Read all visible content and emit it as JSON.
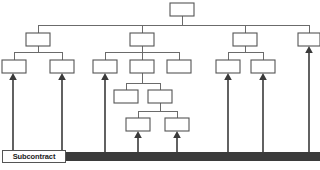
{
  "diagram": {
    "type": "work-breakdown-structure",
    "title": "",
    "canvas": {
      "width": 320,
      "height": 170,
      "background": "#ffffff"
    },
    "colors": {
      "box_fill": "#ffffff",
      "box_stroke": "#555555",
      "connector": "#6b6b6b",
      "arrow": "#3a3a3a",
      "bar": "#3b3b3b",
      "label_text": "#1a1a1a"
    },
    "labels": {
      "subcontract": "Subcontract"
    },
    "bus_line_y": 25,
    "bar": {
      "x": 8,
      "y": 152,
      "width": 312,
      "height": 9
    },
    "subcontract_chip": {
      "x": 2,
      "y": 150,
      "width": 64,
      "height": 13
    },
    "boxes": [
      {
        "id": "n0",
        "level": 1,
        "x": 170,
        "y": 3,
        "w": 24,
        "h": 13,
        "label": ""
      },
      {
        "id": "n1",
        "level": 2,
        "x": 26,
        "y": 33,
        "w": 24,
        "h": 13,
        "label": ""
      },
      {
        "id": "n2",
        "level": 2,
        "x": 130,
        "y": 33,
        "w": 24,
        "h": 13,
        "label": ""
      },
      {
        "id": "n3",
        "level": 2,
        "x": 233,
        "y": 33,
        "w": 24,
        "h": 13,
        "label": ""
      },
      {
        "id": "n4",
        "level": 2,
        "x": 298,
        "y": 33,
        "w": 22,
        "h": 13,
        "label": ""
      },
      {
        "id": "n5",
        "level": 3,
        "x": 2,
        "y": 60,
        "w": 24,
        "h": 13,
        "label": ""
      },
      {
        "id": "n6",
        "level": 3,
        "x": 50,
        "y": 60,
        "w": 24,
        "h": 13,
        "label": ""
      },
      {
        "id": "n7",
        "level": 3,
        "x": 93,
        "y": 60,
        "w": 24,
        "h": 13,
        "label": ""
      },
      {
        "id": "n8",
        "level": 3,
        "x": 130,
        "y": 60,
        "w": 24,
        "h": 13,
        "label": ""
      },
      {
        "id": "n9",
        "level": 3,
        "x": 167,
        "y": 60,
        "w": 24,
        "h": 13,
        "label": ""
      },
      {
        "id": "n10",
        "level": 3,
        "x": 216,
        "y": 60,
        "w": 24,
        "h": 13,
        "label": ""
      },
      {
        "id": "n11",
        "level": 3,
        "x": 251,
        "y": 60,
        "w": 24,
        "h": 13,
        "label": ""
      },
      {
        "id": "n12",
        "level": 4,
        "x": 114,
        "y": 90,
        "w": 24,
        "h": 13,
        "label": ""
      },
      {
        "id": "n13",
        "level": 4,
        "x": 148,
        "y": 90,
        "w": 24,
        "h": 13,
        "label": ""
      },
      {
        "id": "n14",
        "level": 5,
        "x": 126,
        "y": 118,
        "w": 24,
        "h": 13,
        "label": ""
      },
      {
        "id": "n15",
        "level": 5,
        "x": 165,
        "y": 118,
        "w": 24,
        "h": 13,
        "label": ""
      }
    ],
    "supply_arrows": [
      {
        "x": 13,
        "top": 73,
        "bottom": 152
      },
      {
        "x": 62,
        "top": 73,
        "bottom": 152
      },
      {
        "x": 105,
        "top": 73,
        "bottom": 152
      },
      {
        "x": 138,
        "top": 131,
        "bottom": 152
      },
      {
        "x": 177,
        "top": 131,
        "bottom": 152
      },
      {
        "x": 228,
        "top": 73,
        "bottom": 152
      },
      {
        "x": 263,
        "top": 73,
        "bottom": 152
      },
      {
        "x": 309,
        "top": 46,
        "bottom": 152
      }
    ]
  }
}
